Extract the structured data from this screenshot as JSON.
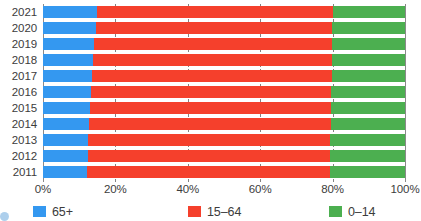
{
  "chart_data": {
    "type": "bar",
    "orientation": "horizontal",
    "stacked": true,
    "stack_mode": "percent",
    "title": "",
    "subtitle": "",
    "xlabel": "",
    "ylabel": "",
    "xlim": [
      0,
      100
    ],
    "x_tick_labels": [
      "0%",
      "20%",
      "40%",
      "60%",
      "80%",
      "100%"
    ],
    "x_tick_values": [
      0,
      20,
      40,
      60,
      80,
      100
    ],
    "grid": true,
    "grid_axis": "x",
    "grid_style": "dashed",
    "legend_position": "bottom",
    "categories": [
      "2021",
      "2020",
      "2019",
      "2018",
      "2017",
      "2016",
      "2015",
      "2014",
      "2013",
      "2012",
      "2011"
    ],
    "series": [
      {
        "name": "65+",
        "color": "#3498f0",
        "values": [
          15.0,
          14.6,
          14.2,
          13.8,
          13.5,
          13.2,
          12.9,
          12.7,
          12.5,
          12.3,
          12.1
        ]
      },
      {
        "name": "15–64",
        "color": "#f5402c",
        "values": [
          65.0,
          65.3,
          65.6,
          66.0,
          66.2,
          66.4,
          66.6,
          66.8,
          66.9,
          67.1,
          67.3
        ]
      },
      {
        "name": "0–14",
        "color": "#4caf50",
        "values": [
          20.0,
          20.1,
          20.2,
          20.2,
          20.3,
          20.4,
          20.5,
          20.5,
          20.6,
          20.6,
          20.6
        ]
      }
    ]
  },
  "legend": {
    "items": [
      {
        "label": "65+",
        "color": "#3498f0"
      },
      {
        "label": "15–64",
        "color": "#f5402c"
      },
      {
        "label": "0–14",
        "color": "#4caf50"
      }
    ]
  },
  "colors": {
    "blue_65_plus": "#3498f0",
    "red_15_64": "#f5402c",
    "green_0_14": "#4caf50",
    "gridline": "#6d6d6d",
    "text": "#3c3c3c",
    "background": "#ffffff"
  }
}
